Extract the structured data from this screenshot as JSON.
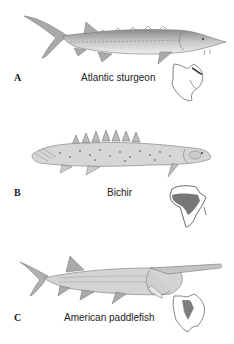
{
  "figure": {
    "panels": [
      {
        "letter": "A",
        "name": "Atlantic sturgeon",
        "range_map": "north-america-east-coast"
      },
      {
        "letter": "B",
        "name": "Bichir",
        "range_map": "africa"
      },
      {
        "letter": "C",
        "name": "American paddlefish",
        "range_map": "north-america-mississippi"
      }
    ]
  }
}
